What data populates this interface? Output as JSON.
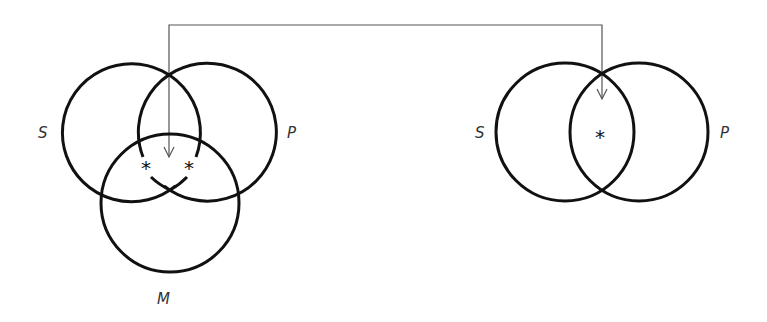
{
  "diagram": {
    "type": "venn",
    "left": {
      "circles": [
        {
          "label": "S",
          "cx": 132,
          "cy": 132,
          "r": 69
        },
        {
          "label": "P",
          "cx": 207,
          "cy": 132,
          "r": 69
        },
        {
          "label": "M",
          "cx": 170,
          "cy": 203,
          "r": 69
        }
      ],
      "labels": {
        "s": "S",
        "p": "P",
        "m": "M"
      },
      "marks": [
        "*",
        "*"
      ]
    },
    "right": {
      "circles": [
        {
          "label": "S",
          "cx": 565,
          "cy": 132,
          "r": 69
        },
        {
          "label": "P",
          "cx": 639,
          "cy": 132,
          "r": 69
        }
      ],
      "labels": {
        "s": "S",
        "p": "P"
      },
      "marks": [
        "*"
      ]
    },
    "connector": {
      "from": "left S∩P region",
      "to": "right S∩P region",
      "style": "arrow"
    },
    "stroke_color": "#111111",
    "connector_color": "#444444"
  }
}
